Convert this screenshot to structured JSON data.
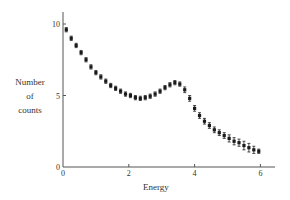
{
  "chart_data": {
    "type": "scatter",
    "title": "",
    "xlabel": "Energy",
    "ylabel": "Number of counts",
    "ylabel_lines": [
      "Number",
      "of",
      "counts"
    ],
    "xlim": [
      0,
      6.4
    ],
    "ylim": [
      0,
      11
    ],
    "xticks": [
      0,
      2,
      4,
      6
    ],
    "yticks": [
      0,
      5,
      10
    ],
    "xtick_labels": [
      "0",
      "2",
      "4",
      "6"
    ],
    "ytick_labels": [
      "0",
      "5",
      "10"
    ],
    "grid": false,
    "legend": null,
    "marker": "square",
    "error_bars": true,
    "series": [
      {
        "name": "data",
        "x": [
          0.1,
          0.25,
          0.4,
          0.55,
          0.7,
          0.85,
          1.0,
          1.15,
          1.3,
          1.45,
          1.6,
          1.75,
          1.9,
          2.05,
          2.2,
          2.35,
          2.5,
          2.65,
          2.8,
          2.95,
          3.1,
          3.25,
          3.4,
          3.55,
          3.7,
          3.85,
          4.0,
          4.15,
          4.3,
          4.45,
          4.6,
          4.75,
          4.9,
          5.05,
          5.2,
          5.35,
          5.5,
          5.65,
          5.8,
          5.95
        ],
        "y": [
          9.6,
          9.0,
          8.5,
          8.0,
          7.5,
          7.0,
          6.6,
          6.3,
          6.0,
          5.7,
          5.5,
          5.3,
          5.1,
          5.0,
          4.85,
          4.8,
          4.85,
          4.95,
          5.1,
          5.3,
          5.55,
          5.75,
          5.9,
          5.8,
          5.4,
          4.8,
          4.1,
          3.6,
          3.2,
          2.9,
          2.6,
          2.4,
          2.2,
          2.0,
          1.8,
          1.7,
          1.5,
          1.35,
          1.2,
          1.1
        ],
        "yerr": [
          0.15,
          0.15,
          0.15,
          0.15,
          0.15,
          0.15,
          0.15,
          0.15,
          0.15,
          0.15,
          0.15,
          0.15,
          0.15,
          0.15,
          0.15,
          0.15,
          0.15,
          0.15,
          0.15,
          0.15,
          0.15,
          0.15,
          0.15,
          0.15,
          0.2,
          0.2,
          0.2,
          0.2,
          0.2,
          0.2,
          0.2,
          0.2,
          0.2,
          0.25,
          0.25,
          0.25,
          0.3,
          0.3,
          0.25,
          0.15
        ]
      }
    ]
  }
}
